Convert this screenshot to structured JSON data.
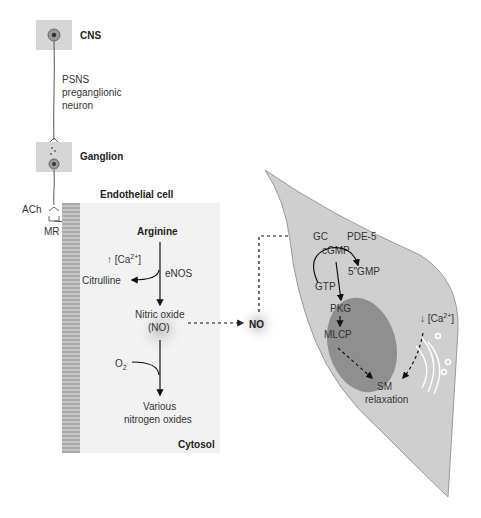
{
  "diagram": {
    "neurons": {
      "cns_label": "CNS",
      "preganglionic_line1": "PSNS",
      "preganglionic_line2": "preganglionic",
      "preganglionic_line3": "neuron",
      "ganglion_label": "Ganglion",
      "ach_label": "ACh",
      "mr_label": "MR"
    },
    "endothelial": {
      "title": "Endothelial cell",
      "arginine": "Arginine",
      "ca_up": "↑ [Ca",
      "ca_sup": "2+",
      "ca_close": "]",
      "citrulline": "Citrulline",
      "enos": "eNOS",
      "no_line1": "Nitric oxide",
      "no_line2": "(NO)",
      "o2": "O",
      "o2_sub": "2",
      "various_line1": "Various",
      "various_line2": "nitrogen oxides",
      "cytosol": "Cytosol"
    },
    "no_diffusing": "NO",
    "smooth_muscle": {
      "gc": "GC",
      "pde5": "PDE-5",
      "cgmp": "cGMP",
      "gmp5": "5\"GMP",
      "gtp": "GTP",
      "pkg": "PKG",
      "mlcp": "MLCP",
      "ca_down": "↓ [Ca",
      "ca_sup": "2+",
      "ca_close": "]",
      "sm_line1": "SM",
      "sm_line2": "relaxation"
    },
    "colors": {
      "cell_fill": "#cfcfcf",
      "nucleus_fill": "#8f8f8f",
      "endothelial_fill": "#f2f2f2",
      "box_fill": "#d6d6d6"
    }
  }
}
